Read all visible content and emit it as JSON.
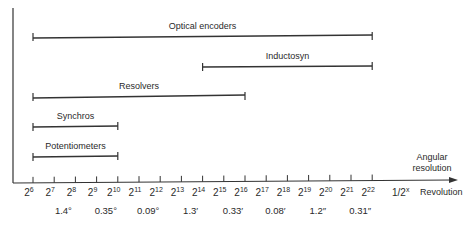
{
  "diagram": {
    "type": "range-bar",
    "axis": {
      "x_label_line1": "Angular",
      "x_label_line2": "resolution",
      "unit_label": "1/2",
      "unit_exponent": "x",
      "unit_word": "Revolution",
      "ticks": [
        {
          "base": "2",
          "exp": "6"
        },
        {
          "base": "2",
          "exp": "7"
        },
        {
          "base": "2",
          "exp": "8"
        },
        {
          "base": "2",
          "exp": "9"
        },
        {
          "base": "2",
          "exp": "10"
        },
        {
          "base": "2",
          "exp": "11"
        },
        {
          "base": "2",
          "exp": "12"
        },
        {
          "base": "2",
          "exp": "13"
        },
        {
          "base": "2",
          "exp": "14"
        },
        {
          "base": "2",
          "exp": "15"
        },
        {
          "base": "2",
          "exp": "16"
        },
        {
          "base": "2",
          "exp": "17"
        },
        {
          "base": "2",
          "exp": "18"
        },
        {
          "base": "2",
          "exp": "19"
        },
        {
          "base": "2",
          "exp": "20"
        },
        {
          "base": "2",
          "exp": "21"
        },
        {
          "base": "2",
          "exp": "22"
        }
      ],
      "resolution_labels": [
        {
          "text": "1.4°",
          "between": [
            8,
            8
          ]
        },
        {
          "text": "0.35°",
          "between": [
            10,
            10
          ]
        },
        {
          "text": "0.09°",
          "between": [
            12,
            12
          ]
        },
        {
          "text": "1.3′",
          "between": [
            14,
            14
          ]
        },
        {
          "text": "0.33′",
          "between": [
            16,
            16
          ]
        },
        {
          "text": "0.08′",
          "between": [
            18,
            18
          ]
        },
        {
          "text": "1.2″",
          "between": [
            20,
            20
          ]
        },
        {
          "text": "0.31″",
          "between": [
            22,
            22
          ]
        }
      ]
    },
    "bars": [
      {
        "name": "Optical encoders",
        "from_exp": 6,
        "to_exp": 22
      },
      {
        "name": "Inductosyn",
        "from_exp": 14,
        "to_exp": 22
      },
      {
        "name": "Resolvers",
        "from_exp": 6,
        "to_exp": 16
      },
      {
        "name": "Synchros",
        "from_exp": 6,
        "to_exp": 10
      },
      {
        "name": "Potentiometers",
        "from_exp": 6,
        "to_exp": 10
      }
    ]
  }
}
